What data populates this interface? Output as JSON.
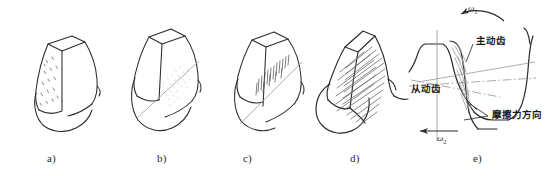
{
  "figure": {
    "panels": [
      {
        "id": "a",
        "caption": "a)",
        "damage_name": "pitting",
        "surface_marks": "scattered-pits"
      },
      {
        "id": "b",
        "caption": "b)",
        "damage_name": "spalling-along-pitch-line",
        "surface_marks": "stippled-band-with-pitch-line"
      },
      {
        "id": "c",
        "caption": "c)",
        "damage_name": "scoring-near-pitch-line",
        "surface_marks": "short-vertical-scratches-with-pitch-line"
      },
      {
        "id": "d",
        "caption": "d)",
        "damage_name": "severe-scuffing",
        "surface_marks": "dense-diagonal-scoring-lines"
      },
      {
        "id": "e",
        "caption": "e)",
        "damage_name": "meshing-friction-direction-diagram",
        "surface_marks": "hatched-contact-band"
      }
    ],
    "mesh_diagram": {
      "driving_tooth_label": "主动齿",
      "driven_tooth_label": "从动齿",
      "friction_direction_label": "摩擦力方向",
      "omega1_label": "ω",
      "omega1_sub": "1",
      "omega2_label": "ω",
      "omega2_sub": "2"
    },
    "colors": {
      "ink": "#1a1a1a",
      "line": "#2b2b2b",
      "hatch": "#8a8a8a",
      "light_line": "#9a9a9a",
      "background": "#ffffff"
    }
  }
}
